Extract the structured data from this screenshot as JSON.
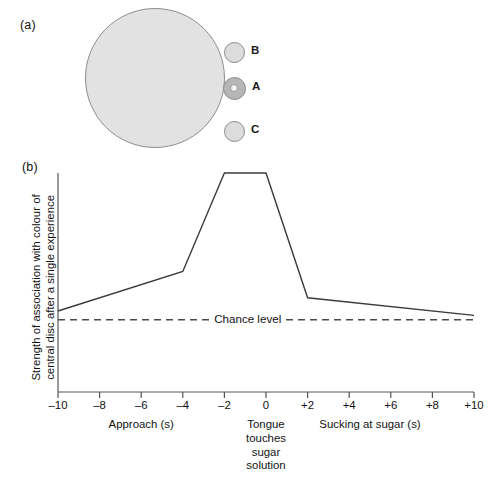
{
  "figure": {
    "panel_a_label": "(a)",
    "panel_b_label": "(b)"
  },
  "panel_a": {
    "name": "bee-landing-disc-diagram",
    "big_disc_color": "#e2e2e2",
    "big_disc_border_color": "#8d8d8d",
    "small_disc_color": "#dcdcdc",
    "center_disc_color": "#b6b6b6",
    "discs": [
      {
        "id": "B",
        "label": "B",
        "type": "plain-disc"
      },
      {
        "id": "A",
        "label": "A",
        "type": "ring-disc"
      },
      {
        "id": "C",
        "label": "C",
        "type": "plain-disc"
      }
    ]
  },
  "chart_data": {
    "type": "line",
    "title": "",
    "ylabel": "Strength of association with colour of\ncentral disc after a single experience",
    "xlabel": "",
    "xlim": [
      -10,
      10
    ],
    "ylim": [
      0,
      1
    ],
    "grid": false,
    "legend": "none",
    "x_ticks": [
      -10,
      -8,
      -6,
      -4,
      -2,
      0,
      2,
      4,
      6,
      8,
      10
    ],
    "x_tick_labels": [
      "–10",
      "–8",
      "–6",
      "–4",
      "–2",
      "0",
      "+2",
      "+4",
      "+6",
      "+8",
      "+10"
    ],
    "y_ticks": [],
    "y_tick_labels": [],
    "series": [
      {
        "name": "Strength of association",
        "style": "solid",
        "color": "#3b3b3b",
        "x": [
          -10,
          -4,
          -2,
          0,
          2,
          10
        ],
        "y": [
          0.37,
          0.55,
          1.0,
          1.0,
          0.43,
          0.35
        ]
      },
      {
        "name": "Chance level",
        "style": "dashed",
        "color": "#4a4a4a",
        "x": [
          -10,
          10
        ],
        "y": [
          0.33,
          0.33
        ]
      }
    ],
    "annotations": [
      {
        "text": "Chance level",
        "x": -1.0,
        "y": 0.33,
        "name": "chance-level-label"
      }
    ],
    "axis_captions": [
      {
        "text": "Approach (s)",
        "x_center": -6.0,
        "name": "approach-caption"
      },
      {
        "text": "Tongue\ntouches\nsugar\nsolution",
        "x_center": 0.0,
        "name": "tongue-touches-caption"
      },
      {
        "text": "Sucking at sugar (s)",
        "x_center": 5.0,
        "name": "sucking-at-sugar-caption"
      }
    ]
  }
}
